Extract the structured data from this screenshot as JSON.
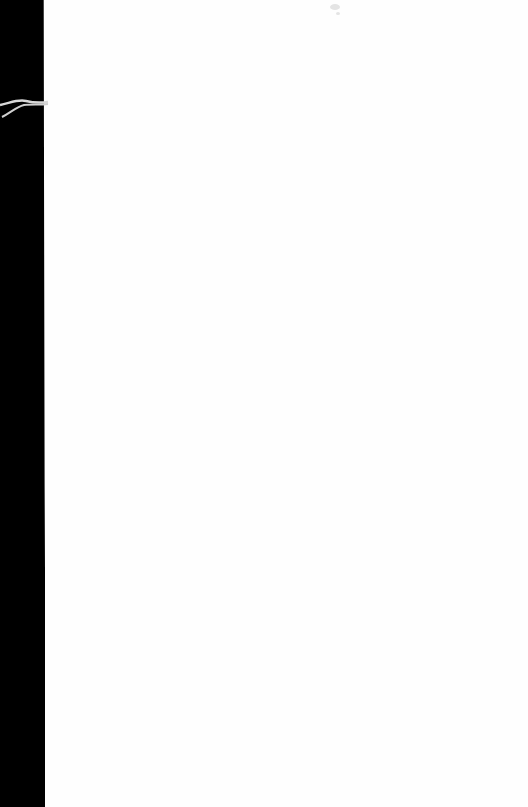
{
  "document": {
    "type": "blank scanned page",
    "text": "",
    "colors": {
      "page": "#fefefe",
      "scan_edge": "#000000",
      "thread": "#d8d8d8"
    },
    "scan_edge_width_top": 44,
    "scan_edge_width_bottom": 48
  }
}
